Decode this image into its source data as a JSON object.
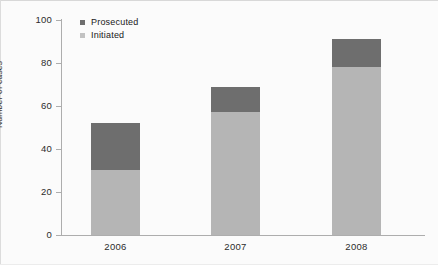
{
  "chart_data": {
    "type": "bar",
    "subtype": "stacked-vertical",
    "title": "",
    "xlabel": "",
    "ylabel": "Number of cases",
    "categories": [
      "2006",
      "2007",
      "2008"
    ],
    "ylim": [
      0,
      100
    ],
    "yticks": [
      0,
      20,
      40,
      60,
      80,
      100
    ],
    "ytick_labels": [
      "0",
      "20",
      "40",
      "60",
      "80",
      "100"
    ],
    "grid": false,
    "legend_position": "top-left-inside",
    "series": [
      {
        "name": "Initiated",
        "color": "#b5b5b5",
        "values": [
          30,
          57,
          78
        ],
        "stack_order": 0
      },
      {
        "name": "Prosecuted",
        "color": "#6e6e6e",
        "values": [
          22,
          12,
          13
        ],
        "stack_order": 1
      }
    ],
    "totals": [
      52,
      69,
      91
    ],
    "background": "#fbfbfb",
    "axis_color": "#adadad"
  },
  "legend": {
    "items": [
      {
        "label": "Prosecuted",
        "swatch": "legend-swatch-prosecuted"
      },
      {
        "label": "Initiated",
        "swatch": "legend-swatch-initiated"
      }
    ]
  }
}
